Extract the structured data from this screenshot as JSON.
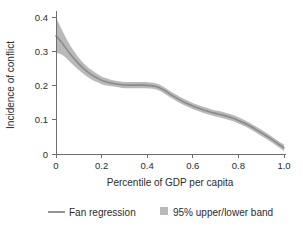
{
  "chart_data": {
    "type": "line",
    "title": "",
    "xlabel": "Percentile of GDP per capita",
    "ylabel": "Incidence of conflict",
    "xlim": [
      0,
      1.0
    ],
    "ylim": [
      0,
      0.4
    ],
    "grid": false,
    "xticks": [
      0,
      0.2,
      0.4,
      0.6,
      0.8,
      1.0
    ],
    "xtick_labels": [
      "0",
      "0.2",
      "0.4",
      "0.6",
      "0.8",
      "1.0"
    ],
    "yticks": [
      0,
      0.1,
      0.2,
      0.3,
      0.4
    ],
    "ytick_labels": [
      "0",
      "0.1",
      "0.2",
      "0.3",
      "0.4"
    ],
    "legend_position": "below-axes",
    "x": [
      0.0,
      0.02,
      0.04,
      0.06,
      0.08,
      0.1,
      0.12,
      0.15,
      0.18,
      0.2,
      0.23,
      0.26,
      0.29,
      0.32,
      0.35,
      0.38,
      0.41,
      0.44,
      0.47,
      0.5,
      0.53,
      0.56,
      0.59,
      0.62,
      0.65,
      0.68,
      0.71,
      0.74,
      0.77,
      0.8,
      0.83,
      0.86,
      0.89,
      0.92,
      0.95,
      0.98,
      1.0
    ],
    "series": [
      {
        "name": "Fan regression",
        "color": "#8a8a8a",
        "values": [
          0.345,
          0.33,
          0.312,
          0.294,
          0.278,
          0.263,
          0.25,
          0.234,
          0.222,
          0.215,
          0.209,
          0.205,
          0.202,
          0.201,
          0.201,
          0.201,
          0.2,
          0.197,
          0.188,
          0.175,
          0.163,
          0.152,
          0.143,
          0.135,
          0.128,
          0.122,
          0.117,
          0.112,
          0.106,
          0.098,
          0.089,
          0.078,
          0.066,
          0.054,
          0.041,
          0.027,
          0.018
        ]
      }
    ],
    "band": {
      "name": "95% upper/lower band",
      "color": "#b9b9b9",
      "upper": [
        0.4,
        0.371,
        0.344,
        0.32,
        0.299,
        0.281,
        0.266,
        0.248,
        0.234,
        0.226,
        0.219,
        0.214,
        0.211,
        0.21,
        0.21,
        0.21,
        0.209,
        0.206,
        0.197,
        0.184,
        0.172,
        0.161,
        0.152,
        0.144,
        0.137,
        0.131,
        0.126,
        0.121,
        0.115,
        0.107,
        0.098,
        0.087,
        0.075,
        0.063,
        0.05,
        0.036,
        0.028
      ],
      "lower": [
        0.294,
        0.292,
        0.283,
        0.27,
        0.257,
        0.245,
        0.234,
        0.22,
        0.21,
        0.204,
        0.199,
        0.196,
        0.193,
        0.192,
        0.192,
        0.192,
        0.191,
        0.188,
        0.179,
        0.166,
        0.154,
        0.143,
        0.134,
        0.126,
        0.119,
        0.113,
        0.108,
        0.103,
        0.097,
        0.089,
        0.08,
        0.069,
        0.057,
        0.045,
        0.032,
        0.018,
        0.008
      ]
    }
  },
  "legend": {
    "items": [
      {
        "label": "Fan regression",
        "marker": "line-swatch",
        "color": "#8a8a8a"
      },
      {
        "label": "95% upper/lower band",
        "marker": "square-swatch",
        "color": "#b9b9b9"
      }
    ]
  },
  "colors": {
    "axis": "#6e6e6e",
    "text": "#2b2b2b",
    "band": "#b9b9b9",
    "line": "#8a8a8a",
    "background": "#ffffff"
  }
}
